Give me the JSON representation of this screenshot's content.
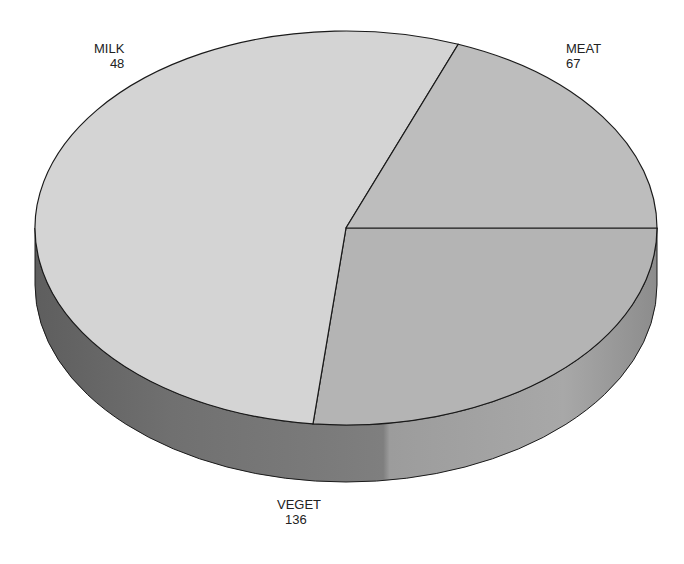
{
  "chart_data": {
    "type": "pie",
    "style": "3d",
    "title": "",
    "categories": [
      "MEAT",
      "VEGET",
      "MILK"
    ],
    "values": [
      67,
      136,
      48
    ],
    "labels": [
      {
        "name": "MILK",
        "value": "48"
      },
      {
        "name": "MEAT",
        "value": "67"
      },
      {
        "name": "VEGET",
        "value": "136"
      }
    ],
    "colors": {
      "MEAT": "#b4b4b4",
      "VEGET": "#d4d4d4",
      "MILK": "#bdbdbd",
      "side_dark": "#6e6e6e",
      "side_mid": "#7d7d7d",
      "side_light": "#9a9a9a",
      "outline": "#1a1a1a"
    },
    "legend": "none",
    "grid": false
  }
}
